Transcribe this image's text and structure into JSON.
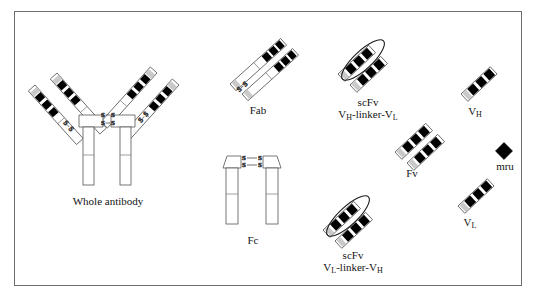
{
  "figure": {
    "background_color": "#ffffff",
    "border_color": "#6d6d6d",
    "fill_dark": "#000000",
    "fill_light": "#ffffff",
    "fill_grey": "#d0d0d0",
    "stroke_color": "#4a4a4a"
  },
  "labels": {
    "whole_antibody": "Whole antibody",
    "fab": "Fab",
    "fc": "Fc",
    "scfv_top_line1": "scFv",
    "scfv_top_line2_a": "V",
    "scfv_top_line2_a_sub": "H",
    "scfv_top_line2_mid": "-linker-",
    "scfv_top_line2_b": "V",
    "scfv_top_line2_b_sub": "L",
    "scfv_bottom_line1": "scFv",
    "scfv_bottom_line2_a": "V",
    "scfv_bottom_line2_a_sub": "L",
    "scfv_bottom_line2_mid": "-linker-",
    "scfv_bottom_line2_b": "V",
    "scfv_bottom_line2_b_sub": "H",
    "fv": "Fv",
    "vh": "V",
    "vh_sub": "H",
    "vl": "V",
    "vl_sub": "L",
    "mru": "mru",
    "disulfide": "S"
  },
  "structures": [
    {
      "name": "whole-antibody",
      "label": "Whole antibody",
      "disulfide_pairs": 4,
      "arms": 4,
      "stems": 2
    },
    {
      "name": "fab",
      "label": "Fab",
      "disulfide_pairs": 1,
      "arms": 2
    },
    {
      "name": "fc",
      "label": "Fc",
      "disulfide_pairs": 2,
      "stems": 2
    },
    {
      "name": "scfv-vh-linker-vl",
      "label": "scFv VH-linker-VL",
      "domains": 2,
      "linker": true
    },
    {
      "name": "scfv-vl-linker-vh",
      "label": "scFv VL-linker-VH",
      "domains": 2,
      "linker": true
    },
    {
      "name": "fv",
      "label": "Fv",
      "domains": 2,
      "linker": false
    },
    {
      "name": "vh-domain",
      "label": "VH",
      "domains": 1
    },
    {
      "name": "vl-domain",
      "label": "VL",
      "domains": 1
    },
    {
      "name": "mru",
      "label": "mru",
      "shape": "diamond"
    }
  ]
}
